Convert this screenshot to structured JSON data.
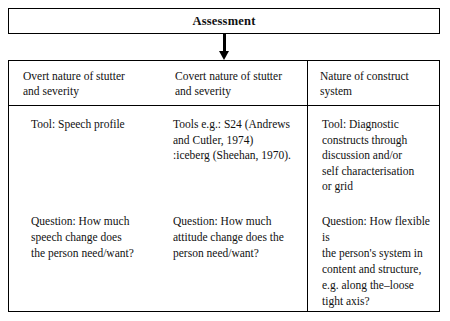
{
  "header": {
    "title": "Assessment"
  },
  "arrow": {
    "name": "down-arrow-icon"
  },
  "columns": [
    {
      "heading_line1": "Overt nature of stutter",
      "heading_line2": "and severity",
      "tool_line1": "Tool: Speech profile",
      "tool_line2": "",
      "tool_line3": "",
      "tool_line4": "",
      "question_line1": "Question: How much",
      "question_line2": "speech  change does",
      "question_line3": "the person need/want?",
      "question_line4": ""
    },
    {
      "heading_line1": "Covert nature of stutter",
      "heading_line2": "and severity",
      "tool_line1": "Tools e.g.: S24 (Andrews",
      "tool_line2": "and Cutler, 1974)",
      "tool_line3": ":iceberg (Sheehan, 1970).",
      "tool_line4": "",
      "question_line1": "Question: How much",
      "question_line2": "attitude change does the",
      "question_line3": "person need/want?",
      "question_line4": ""
    },
    {
      "heading_line1": "Nature of construct",
      "heading_line2": "system",
      "tool_line1": "Tool: Diagnostic",
      "tool_line2": "constructs through",
      "tool_line3": "discussion and/or",
      "tool_line4": "self characterisation",
      "tool_line5": "or grid",
      "question_line1": "Question: How flexible is",
      "question_line2": "the person's system in",
      "question_line3": "content and structure,",
      "question_line4": "e.g. along the–loose",
      "question_line5": "tight axis?"
    }
  ]
}
